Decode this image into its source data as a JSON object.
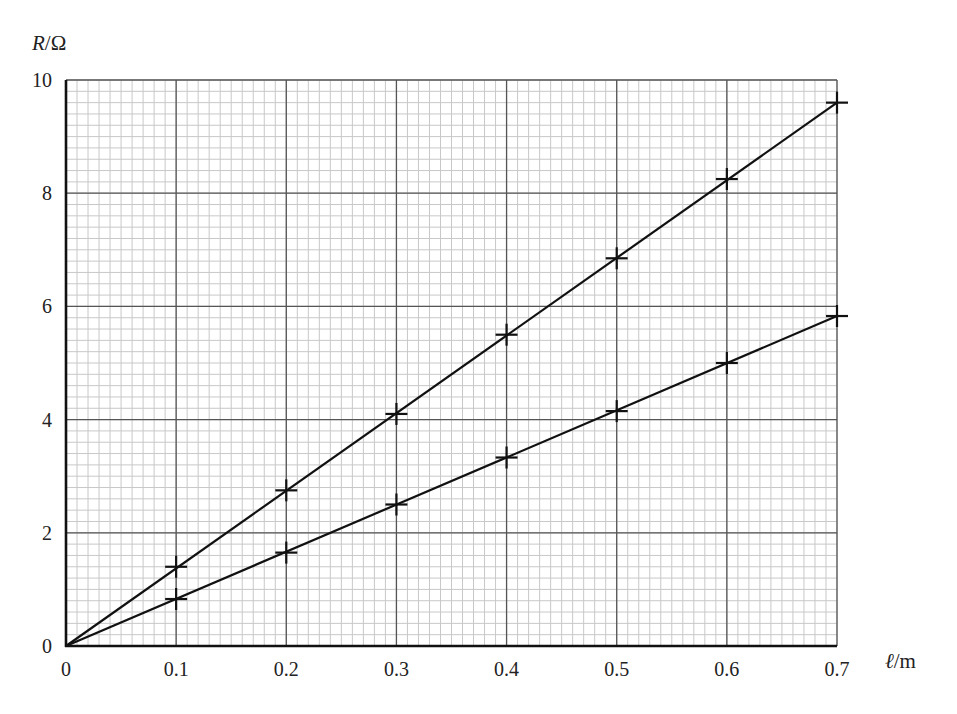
{
  "chart_data": {
    "type": "line",
    "title": "",
    "xlabel": "ℓ/m",
    "ylabel": "R/Ω",
    "ylabel_parts": {
      "var": "R",
      "unit": "/Ω"
    },
    "xlabel_parts": {
      "var": "ℓ",
      "unit": "/m"
    },
    "xlim": [
      0,
      0.7
    ],
    "ylim": [
      0,
      10
    ],
    "x_ticks": [
      "0",
      "0.1",
      "0.2",
      "0.3",
      "0.4",
      "0.5",
      "0.6",
      "0.7"
    ],
    "y_ticks": [
      "0",
      "2",
      "4",
      "6",
      "8",
      "10"
    ],
    "grid": {
      "major_x_step": 0.1,
      "major_y_step": 2,
      "minor_x_step": 0.01,
      "minor_y_step": 0.2
    },
    "legend": null,
    "marker": "plus",
    "x": [
      0.1,
      0.2,
      0.3,
      0.4,
      0.5,
      0.6,
      0.7
    ],
    "series": [
      {
        "name": "upper line",
        "values": [
          1.4,
          2.75,
          4.1,
          5.5,
          6.85,
          8.25,
          9.6
        ],
        "fit_line": [
          [
            0,
            0
          ],
          [
            0.7,
            9.6
          ]
        ]
      },
      {
        "name": "lower line",
        "values": [
          0.83,
          1.65,
          2.5,
          3.33,
          4.15,
          5.0,
          5.83
        ],
        "fit_line": [
          [
            0,
            0
          ],
          [
            0.7,
            5.83
          ]
        ]
      }
    ]
  },
  "colors": {
    "grid_minor": "#c8c8c8",
    "grid_major": "#555555",
    "axis": "#111111",
    "line": "#111111"
  }
}
